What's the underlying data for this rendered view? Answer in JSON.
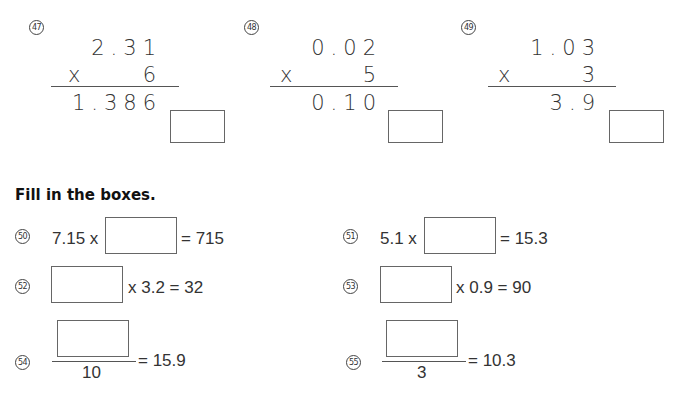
{
  "vertical_problems": [
    {
      "number": "47",
      "multiplicand": "2.31",
      "operator": "x",
      "multiplier": "6",
      "partial_answer": "1.386"
    },
    {
      "number": "48",
      "multiplicand": "0.02",
      "operator": "x",
      "multiplier": "5",
      "partial_answer": "0.10"
    },
    {
      "number": "49",
      "multiplicand": "1.03",
      "operator": "x",
      "multiplier": "3",
      "partial_answer": "3.9"
    }
  ],
  "section": {
    "title": "Fill in the boxes."
  },
  "fill_problems": [
    {
      "number": "50",
      "left": "7.15 x",
      "right": "= 715"
    },
    {
      "number": "51",
      "left": "5.1 x",
      "right": "= 15.3"
    },
    {
      "number": "52",
      "right": "x 3.2 = 32"
    },
    {
      "number": "53",
      "right": "x 0.9 = 90"
    },
    {
      "number": "54",
      "denominator": "10",
      "right": "= 15.9"
    },
    {
      "number": "55",
      "denominator": "3",
      "right": "= 10.3"
    }
  ]
}
